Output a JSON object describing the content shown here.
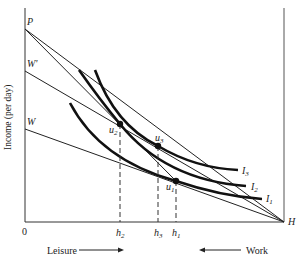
{
  "diagram": {
    "type": "labor-leisure choice diagram",
    "y_axis_label": "Income (per day)",
    "origin_label": "0",
    "y_intercepts": {
      "P": "P",
      "W_prime": "W'",
      "W": "W"
    },
    "x_endpoint": "H",
    "points": {
      "u1": "u",
      "u1_sub": "1",
      "u2": "u",
      "u2_sub": "2",
      "u3": "u",
      "u3_sub": "3"
    },
    "ticks": {
      "h2": "h",
      "h2_sub": "2",
      "h3": "h",
      "h3_sub": "3",
      "h1": "h",
      "h1_sub": "1"
    },
    "curves": {
      "I1": "I",
      "I1_sub": "1",
      "I2": "I",
      "I2_sub": "2",
      "I3": "I",
      "I3_sub": "3"
    },
    "bottom": {
      "leisure": "Leisure",
      "work": "Work"
    },
    "colors": {
      "ink": "#222222",
      "background": "#ffffff"
    }
  }
}
